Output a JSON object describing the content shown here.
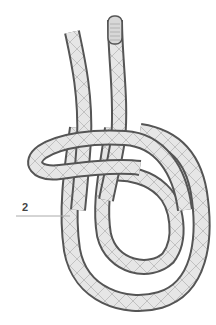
{
  "diagram": {
    "labels": [
      {
        "id": "2",
        "text": "2"
      }
    ],
    "colors": {
      "rope_fill": "#e6e6e6",
      "rope_outline": "#555555",
      "crosshatch": "#b5b5b5",
      "leader_line": "#aaaaaa",
      "background": "#ffffff"
    }
  }
}
